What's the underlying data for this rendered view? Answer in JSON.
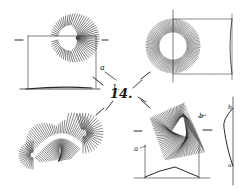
{
  "figure": {
    "number_label": "14.",
    "ink_color": "#2a2a2a",
    "background": "#ffffff"
  },
  "panels": [
    {
      "id": "top-left",
      "shape": "radial-crescent",
      "labels": [
        "a",
        "1."
      ]
    },
    {
      "id": "top-right",
      "shape": "radial-ring",
      "labels": []
    },
    {
      "id": "bottom-left",
      "shape": "radial-peanut",
      "labels": []
    },
    {
      "id": "bottom-right",
      "shape": "radial-triangle",
      "labels": [
        "b",
        "a",
        "b",
        "a"
      ]
    }
  ]
}
